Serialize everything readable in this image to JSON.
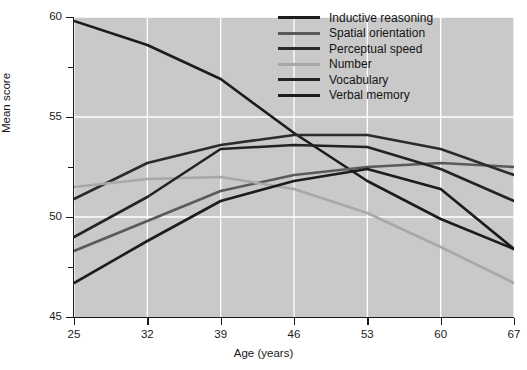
{
  "chart_data": {
    "type": "line",
    "title": "",
    "xlabel": "Age (years)",
    "ylabel": "Mean score",
    "categories": [
      25,
      32,
      39,
      46,
      53,
      60,
      67
    ],
    "x": [
      25,
      32,
      39,
      46,
      53,
      60,
      67
    ],
    "xlim": [
      25,
      67
    ],
    "ylim": [
      45,
      60
    ],
    "y_ticks": [
      45,
      50,
      55,
      60
    ],
    "y_minor_ticks": [
      47.5,
      52.5,
      57.5
    ],
    "x_ticks": [
      25,
      32,
      39,
      46,
      53,
      60,
      67
    ],
    "grid": "white gridlines on gray panel, vertical at each age tick, horizontal at major y ticks",
    "legend_position": "top-right inside plot",
    "series": [
      {
        "name": "Inductive reasoning",
        "color": "#1c1c1c",
        "values": [
          59.8,
          58.6,
          56.9,
          54.2,
          51.8,
          49.9,
          48.4
        ]
      },
      {
        "name": "Spatial orientation",
        "color": "#5a5a5a",
        "values": [
          48.3,
          49.8,
          51.3,
          52.1,
          52.5,
          52.7,
          52.5
        ]
      },
      {
        "name": "Perceptual speed",
        "color": "#2b2b2b",
        "values": [
          50.9,
          52.7,
          53.6,
          54.1,
          54.1,
          53.4,
          52.1
        ]
      },
      {
        "name": "Number",
        "color": "#a8a8a8",
        "values": [
          51.5,
          51.9,
          52.0,
          51.4,
          50.2,
          48.5,
          46.7
        ]
      },
      {
        "name": "Vocabulary",
        "color": "#232323",
        "values": [
          49.0,
          51.0,
          53.4,
          53.6,
          53.5,
          52.4,
          50.8
        ]
      },
      {
        "name": "Verbal memory",
        "color": "#1c1c1c",
        "values": [
          46.7,
          48.8,
          50.8,
          51.8,
          52.4,
          51.4,
          48.4
        ]
      }
    ]
  },
  "legend": {
    "items": [
      {
        "label": "Inductive reasoning"
      },
      {
        "label": "Spatial orientation"
      },
      {
        "label": "Perceptual speed"
      },
      {
        "label": "Number"
      },
      {
        "label": "Vocabulary"
      },
      {
        "label": "Verbal memory"
      }
    ]
  },
  "colors": {
    "panel_background": "#c9c9c9",
    "figure_background": "#ffffff",
    "gridline": "#ffffff",
    "axis": "#1a1a1a",
    "text": "#1a1a1a"
  }
}
